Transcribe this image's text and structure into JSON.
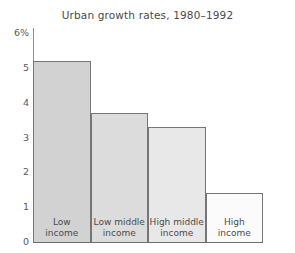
{
  "chart_data": {
    "type": "bar",
    "title": "Urban growth rates, 1980–1992",
    "xlabel": "",
    "ylabel": "",
    "categories": [
      "Low income",
      "Low middle income",
      "High middle income",
      "High income"
    ],
    "values": [
      5.2,
      3.7,
      3.3,
      1.4
    ],
    "ylim": [
      0,
      6
    ],
    "yticks": [
      0,
      1,
      2,
      3,
      4,
      5,
      6
    ],
    "ytick_labels": [
      "0",
      "1",
      "2",
      "3",
      "4",
      "5",
      "6%"
    ],
    "grid": false,
    "legend": null,
    "bar_colors": [
      "#d2d2d2",
      "#dcdcdc",
      "#e8e8e8",
      "#fbfbfb"
    ],
    "bar_edge_color": "#767676",
    "axis_color": "#6e6e6e",
    "text_color": "#4a4a4a",
    "bar_label_lines": [
      [
        "Low",
        "income"
      ],
      [
        "Low middle",
        "income"
      ],
      [
        "High middle",
        "income"
      ],
      [
        "High",
        "income"
      ]
    ]
  }
}
